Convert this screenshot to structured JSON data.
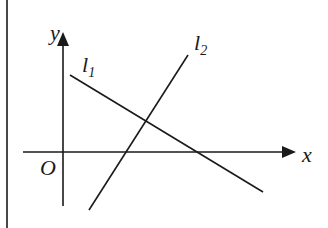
{
  "diagram": {
    "type": "coordinate-plane-lines",
    "axes": {
      "x_label": "x",
      "y_label": "y",
      "origin_label": "O"
    },
    "lines": [
      {
        "id": "l1",
        "label_base": "l",
        "label_sub": "1",
        "slope_sign": "negative"
      },
      {
        "id": "l2",
        "label_base": "l",
        "label_sub": "2",
        "slope_sign": "positive"
      }
    ],
    "colors": {
      "stroke": "#1a1a1a",
      "background": "#ffffff"
    }
  }
}
